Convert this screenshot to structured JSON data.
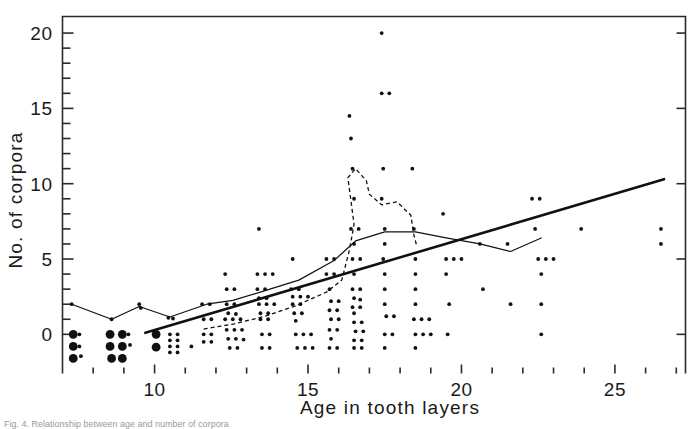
{
  "figure": {
    "caption_fragment": "Fig. 4. Relationship between age and number of corpora"
  },
  "chart_data": {
    "type": "scatter",
    "title": "",
    "xlabel": "Age in tooth layers",
    "ylabel": "No. of corpora",
    "xlim": [
      7.0,
      27.3
    ],
    "ylim": [
      -2.6,
      21.1
    ],
    "xticks_major": [
      10,
      15,
      20,
      25
    ],
    "xticks_major_labels": [
      "10",
      "15",
      "20",
      "25"
    ],
    "xticks_minor": [
      8,
      9,
      11,
      12,
      13,
      14,
      16,
      17,
      18,
      19,
      21,
      22,
      23,
      24,
      26,
      27
    ],
    "yticks_major": [
      0,
      5,
      10,
      15,
      20
    ],
    "yticks_major_labels": [
      "0",
      "5",
      "10",
      "15",
      "20"
    ],
    "yticks_minor": [
      1,
      2,
      3,
      4,
      6,
      7,
      8,
      9,
      11,
      12,
      13,
      14,
      16,
      17,
      18,
      19
    ],
    "grid": false,
    "legend": "none",
    "marker_color": "#111111",
    "line_color": "#111111",
    "points": [
      [
        7.3,
        2.0
      ],
      [
        7.3,
        0.0
      ],
      [
        7.55,
        0.0
      ],
      [
        7.3,
        -0.75
      ],
      [
        7.55,
        -0.8
      ],
      [
        7.3,
        -1.5
      ],
      [
        7.6,
        -1.45
      ],
      [
        8.6,
        1.0
      ],
      [
        8.55,
        0.0
      ],
      [
        8.9,
        0.0
      ],
      [
        9.15,
        0.0
      ],
      [
        8.6,
        -0.75
      ],
      [
        8.9,
        -0.75
      ],
      [
        9.2,
        -0.7
      ],
      [
        8.6,
        -1.5
      ],
      [
        9.0,
        -1.5
      ],
      [
        9.5,
        2.0
      ],
      [
        9.55,
        1.75
      ],
      [
        10.0,
        0.0
      ],
      [
        10.0,
        -0.9
      ],
      [
        10.45,
        1.1
      ],
      [
        10.6,
        1.05
      ],
      [
        10.5,
        0.0
      ],
      [
        10.75,
        0.0
      ],
      [
        10.5,
        -0.4
      ],
      [
        10.75,
        -0.4
      ],
      [
        10.5,
        -0.8
      ],
      [
        10.75,
        -0.8
      ],
      [
        10.5,
        -1.2
      ],
      [
        10.75,
        -1.2
      ],
      [
        11.2,
        -0.8
      ],
      [
        11.55,
        2.0
      ],
      [
        11.8,
        2.0
      ],
      [
        11.6,
        1.0
      ],
      [
        11.85,
        1.0
      ],
      [
        11.6,
        0.0
      ],
      [
        11.85,
        0.0
      ],
      [
        11.6,
        -0.5
      ],
      [
        11.85,
        -0.5
      ],
      [
        12.3,
        4.0
      ],
      [
        12.35,
        3.0
      ],
      [
        12.6,
        3.0
      ],
      [
        12.35,
        2.0
      ],
      [
        12.6,
        2.0
      ],
      [
        12.4,
        1.4
      ],
      [
        12.65,
        1.35
      ],
      [
        12.3,
        1.0
      ],
      [
        12.55,
        1.0
      ],
      [
        12.8,
        1.0
      ],
      [
        12.35,
        0.3
      ],
      [
        12.6,
        0.3
      ],
      [
        12.85,
        0.3
      ],
      [
        12.4,
        -0.3
      ],
      [
        12.65,
        -0.3
      ],
      [
        12.9,
        -0.35
      ],
      [
        12.45,
        -0.9
      ],
      [
        12.7,
        -0.9
      ],
      [
        13.4,
        7.0
      ],
      [
        13.35,
        4.0
      ],
      [
        13.6,
        4.0
      ],
      [
        13.85,
        4.0
      ],
      [
        13.35,
        3.0
      ],
      [
        13.6,
        3.0
      ],
      [
        13.4,
        2.4
      ],
      [
        13.65,
        2.4
      ],
      [
        13.4,
        2.0
      ],
      [
        13.65,
        2.0
      ],
      [
        13.9,
        2.0
      ],
      [
        13.45,
        1.4
      ],
      [
        13.7,
        1.4
      ],
      [
        13.45,
        1.0
      ],
      [
        13.7,
        1.0
      ],
      [
        13.5,
        0.0
      ],
      [
        13.75,
        0.0
      ],
      [
        13.5,
        -0.9
      ],
      [
        13.75,
        -0.9
      ],
      [
        14.5,
        5.0
      ],
      [
        14.45,
        3.0
      ],
      [
        14.7,
        3.0
      ],
      [
        14.5,
        2.5
      ],
      [
        14.75,
        2.5
      ],
      [
        15.0,
        2.5
      ],
      [
        14.5,
        2.0
      ],
      [
        14.75,
        2.0
      ],
      [
        14.55,
        1.4
      ],
      [
        14.8,
        1.4
      ],
      [
        14.6,
        0.9
      ],
      [
        14.6,
        0.0
      ],
      [
        14.85,
        0.0
      ],
      [
        15.1,
        0.0
      ],
      [
        14.65,
        -0.9
      ],
      [
        14.9,
        -0.9
      ],
      [
        15.15,
        -0.9
      ],
      [
        15.6,
        5.0
      ],
      [
        15.85,
        5.0
      ],
      [
        15.6,
        4.0
      ],
      [
        15.85,
        4.0
      ],
      [
        15.7,
        3.0
      ],
      [
        15.75,
        2.2
      ],
      [
        16.0,
        2.2
      ],
      [
        15.7,
        1.6
      ],
      [
        15.95,
        1.6
      ],
      [
        15.75,
        1.0
      ],
      [
        16.0,
        1.0
      ],
      [
        15.7,
        0.3
      ],
      [
        15.95,
        0.3
      ],
      [
        15.75,
        -0.3
      ],
      [
        15.7,
        -0.9
      ],
      [
        15.95,
        -0.9
      ],
      [
        16.35,
        14.5
      ],
      [
        16.4,
        13.0
      ],
      [
        16.45,
        11.0
      ],
      [
        16.5,
        9.0
      ],
      [
        16.4,
        7.0
      ],
      [
        16.65,
        7.0
      ],
      [
        16.5,
        6.0
      ],
      [
        16.45,
        5.0
      ],
      [
        16.7,
        5.0
      ],
      [
        16.5,
        4.0
      ],
      [
        16.45,
        3.0
      ],
      [
        16.7,
        3.0
      ],
      [
        16.5,
        2.4
      ],
      [
        16.7,
        2.3
      ],
      [
        16.45,
        1.8
      ],
      [
        16.7,
        1.8
      ],
      [
        16.5,
        1.4
      ],
      [
        16.5,
        0.8
      ],
      [
        16.75,
        0.8
      ],
      [
        16.55,
        0.2
      ],
      [
        16.8,
        0.2
      ],
      [
        16.5,
        -0.4
      ],
      [
        16.75,
        -0.4
      ],
      [
        16.5,
        -0.9
      ],
      [
        16.75,
        -0.9
      ],
      [
        17.4,
        20.0
      ],
      [
        17.4,
        16.0
      ],
      [
        17.65,
        16.0
      ],
      [
        17.45,
        11.0
      ],
      [
        17.4,
        9.0
      ],
      [
        17.5,
        7.0
      ],
      [
        17.5,
        6.0
      ],
      [
        17.45,
        5.0
      ],
      [
        17.5,
        4.0
      ],
      [
        17.5,
        3.0
      ],
      [
        17.5,
        2.0
      ],
      [
        17.55,
        1.2
      ],
      [
        17.8,
        1.2
      ],
      [
        17.5,
        0.0
      ],
      [
        17.75,
        0.0
      ],
      [
        17.5,
        -0.9
      ],
      [
        18.4,
        11.0
      ],
      [
        18.45,
        7.0
      ],
      [
        18.5,
        5.0
      ],
      [
        18.5,
        4.0
      ],
      [
        18.5,
        3.0
      ],
      [
        18.5,
        2.0
      ],
      [
        18.45,
        1.0
      ],
      [
        18.7,
        1.0
      ],
      [
        18.95,
        1.0
      ],
      [
        18.5,
        0.0
      ],
      [
        18.75,
        0.0
      ],
      [
        19.0,
        0.0
      ],
      [
        18.5,
        -0.9
      ],
      [
        19.4,
        8.0
      ],
      [
        19.5,
        5.0
      ],
      [
        19.75,
        5.0
      ],
      [
        20.0,
        5.0
      ],
      [
        19.5,
        4.0
      ],
      [
        19.6,
        2.0
      ],
      [
        19.55,
        0.0
      ],
      [
        20.6,
        6.0
      ],
      [
        20.7,
        3.0
      ],
      [
        21.5,
        6.0
      ],
      [
        21.6,
        2.0
      ],
      [
        22.3,
        9.0
      ],
      [
        22.55,
        9.0
      ],
      [
        22.4,
        7.0
      ],
      [
        22.5,
        5.0
      ],
      [
        22.75,
        5.0
      ],
      [
        23.0,
        5.0
      ],
      [
        22.6,
        4.0
      ],
      [
        22.6,
        2.0
      ],
      [
        22.6,
        0.0
      ],
      [
        23.9,
        7.0
      ],
      [
        26.5,
        7.0
      ],
      [
        26.5,
        6.0
      ]
    ],
    "big_points": [
      [
        7.35,
        0.0
      ],
      [
        7.35,
        -0.8
      ],
      [
        7.35,
        -1.6
      ],
      [
        8.55,
        0.0
      ],
      [
        8.95,
        0.0
      ],
      [
        8.55,
        -0.8
      ],
      [
        8.95,
        -0.8
      ],
      [
        8.6,
        -1.6
      ],
      [
        8.95,
        -1.6
      ],
      [
        10.05,
        0.0
      ],
      [
        10.05,
        -0.85
      ]
    ],
    "lines": [
      {
        "name": "regression-line",
        "style": "solid-thick",
        "points": [
          [
            9.7,
            0.1
          ],
          [
            26.6,
            10.3
          ]
        ]
      },
      {
        "name": "mean-line",
        "style": "solid-thin",
        "points": [
          [
            7.3,
            2.0
          ],
          [
            8.6,
            1.0
          ],
          [
            9.5,
            1.85
          ],
          [
            10.5,
            1.15
          ],
          [
            11.7,
            2.0
          ],
          [
            12.55,
            2.25
          ],
          [
            13.6,
            2.9
          ],
          [
            14.7,
            3.6
          ],
          [
            15.85,
            4.9
          ],
          [
            16.55,
            6.2
          ],
          [
            17.5,
            6.8
          ],
          [
            18.5,
            6.8
          ],
          [
            19.5,
            6.4
          ],
          [
            20.6,
            6.0
          ],
          [
            21.6,
            5.5
          ],
          [
            22.6,
            6.4
          ]
        ]
      },
      {
        "name": "median-line",
        "style": "dashed",
        "points": [
          [
            11.6,
            0.35
          ],
          [
            12.6,
            0.7
          ],
          [
            13.6,
            1.2
          ],
          [
            14.6,
            1.9
          ],
          [
            15.6,
            2.8
          ],
          [
            16.1,
            3.6
          ],
          [
            16.35,
            5.6
          ],
          [
            16.5,
            7.3
          ],
          [
            16.3,
            10.4
          ],
          [
            16.55,
            11.0
          ],
          [
            16.9,
            10.2
          ],
          [
            17.0,
            9.3
          ],
          [
            17.4,
            8.6
          ],
          [
            17.9,
            8.8
          ],
          [
            18.35,
            7.9
          ],
          [
            18.45,
            6.6
          ],
          [
            18.55,
            5.8
          ]
        ]
      }
    ]
  }
}
